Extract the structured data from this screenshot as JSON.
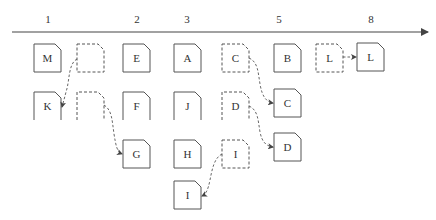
{
  "colors": {
    "stroke": "#555555",
    "text": "#333333",
    "background": "#ffffff"
  },
  "axis": {
    "ticks": [
      {
        "label": "1",
        "x": 48
      },
      {
        "label": "2",
        "x": 137
      },
      {
        "label": "3",
        "x": 187
      },
      {
        "label": "5",
        "x": 279
      },
      {
        "label": "8",
        "x": 371
      }
    ]
  },
  "boxes": [
    {
      "id": "m",
      "label": "M",
      "x": 34,
      "y": 44,
      "w": 27,
      "h": 28,
      "style": "solid",
      "open_bottom": false
    },
    {
      "id": "empty1",
      "label": "",
      "x": 77,
      "y": 44,
      "w": 27,
      "h": 28,
      "style": "dashed",
      "open_bottom": false
    },
    {
      "id": "e",
      "label": "E",
      "x": 123,
      "y": 44,
      "w": 27,
      "h": 28,
      "style": "solid",
      "open_bottom": false
    },
    {
      "id": "a",
      "label": "A",
      "x": 174,
      "y": 44,
      "w": 27,
      "h": 28,
      "style": "solid",
      "open_bottom": false
    },
    {
      "id": "c-dash",
      "label": "C",
      "x": 222,
      "y": 44,
      "w": 27,
      "h": 28,
      "style": "dashed",
      "open_bottom": false
    },
    {
      "id": "b",
      "label": "B",
      "x": 274,
      "y": 44,
      "w": 27,
      "h": 28,
      "style": "solid",
      "open_bottom": false
    },
    {
      "id": "l-dash",
      "label": "L",
      "x": 316,
      "y": 44,
      "w": 27,
      "h": 28,
      "style": "dashed",
      "open_bottom": false
    },
    {
      "id": "l",
      "label": "L",
      "x": 357,
      "y": 43,
      "w": 27,
      "h": 28,
      "style": "solid",
      "open_bottom": false
    },
    {
      "id": "k",
      "label": "K",
      "x": 34,
      "y": 92,
      "w": 27,
      "h": 28,
      "style": "solid",
      "open_bottom": true
    },
    {
      "id": "empty2",
      "label": "",
      "x": 77,
      "y": 92,
      "w": 27,
      "h": 28,
      "style": "dashed",
      "open_bottom": true
    },
    {
      "id": "f",
      "label": "F",
      "x": 123,
      "y": 92,
      "w": 27,
      "h": 28,
      "style": "solid",
      "open_bottom": true
    },
    {
      "id": "j",
      "label": "J",
      "x": 174,
      "y": 92,
      "w": 27,
      "h": 28,
      "style": "solid",
      "open_bottom": true
    },
    {
      "id": "d-dash",
      "label": "D",
      "x": 222,
      "y": 92,
      "w": 27,
      "h": 28,
      "style": "dashed",
      "open_bottom": true
    },
    {
      "id": "c",
      "label": "C",
      "x": 274,
      "y": 89,
      "w": 27,
      "h": 28,
      "style": "solid",
      "open_bottom": false
    },
    {
      "id": "g",
      "label": "G",
      "x": 123,
      "y": 140,
      "w": 27,
      "h": 28,
      "style": "solid",
      "open_bottom": false
    },
    {
      "id": "h",
      "label": "H",
      "x": 174,
      "y": 140,
      "w": 27,
      "h": 28,
      "style": "solid",
      "open_bottom": false
    },
    {
      "id": "i-dash",
      "label": "I",
      "x": 222,
      "y": 140,
      "w": 27,
      "h": 28,
      "style": "dashed",
      "open_bottom": false
    },
    {
      "id": "d",
      "label": "D",
      "x": 274,
      "y": 133,
      "w": 27,
      "h": 28,
      "style": "solid",
      "open_bottom": false
    },
    {
      "id": "i",
      "label": "I",
      "x": 174,
      "y": 181,
      "w": 27,
      "h": 28,
      "style": "solid",
      "open_bottom": false
    }
  ],
  "edges": [
    {
      "from": "empty1",
      "to": "k"
    },
    {
      "from": "empty2",
      "to": "g"
    },
    {
      "from": "c-dash",
      "to": "c"
    },
    {
      "from": "d-dash",
      "to": "d"
    },
    {
      "from": "i-dash",
      "to": "i"
    },
    {
      "from": "l-dash",
      "to": "l"
    }
  ]
}
